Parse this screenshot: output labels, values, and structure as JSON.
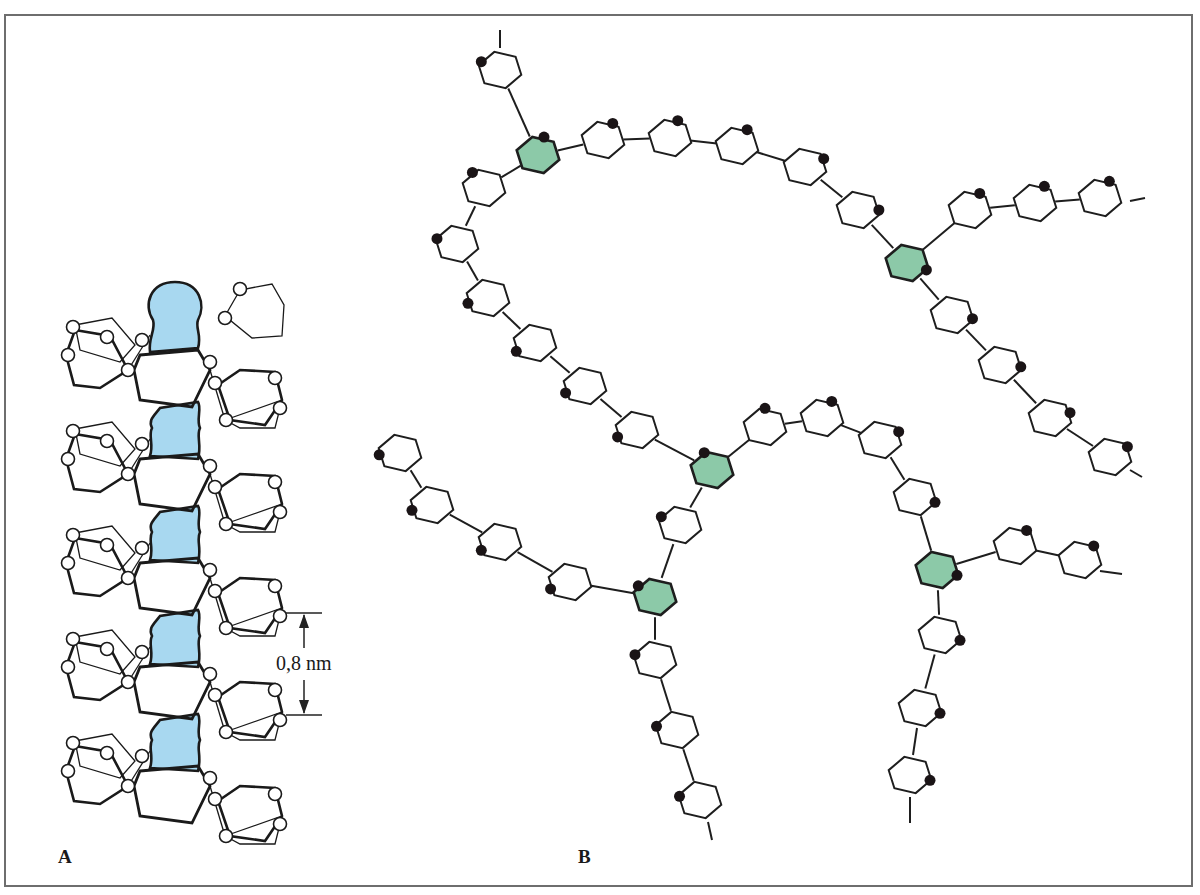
{
  "figure": {
    "panel_a": {
      "label": "A",
      "subject": "helical chain with blue central inclusion",
      "dimension_label": "0,8 nm",
      "inclusion_color": "#a8d8f0",
      "turns": 5
    },
    "panel_b": {
      "label": "B",
      "subject": "branched chain of hexagonal rings",
      "branch_color": "#8cc9a8",
      "ring_radius": 22,
      "rings": [
        {
          "x": 500,
          "y": 70,
          "r": 22,
          "dot": [
            -1,
            -0.5
          ],
          "branch": false
        },
        {
          "x": 538,
          "y": 155,
          "dot": [
            0.3,
            -1
          ],
          "branch": true
        },
        {
          "x": 603,
          "y": 140,
          "dot": [
            0.5,
            -0.95
          ],
          "branch": false
        },
        {
          "x": 670,
          "y": 138,
          "dot": [
            0.4,
            -1
          ],
          "branch": false
        },
        {
          "x": 737,
          "y": 146,
          "dot": [
            0.5,
            -0.9
          ],
          "branch": false
        },
        {
          "x": 805,
          "y": 167,
          "dot": [
            1,
            -0.5
          ],
          "branch": false
        },
        {
          "x": 858,
          "y": 210,
          "dot": [
            1,
            0
          ],
          "branch": false
        },
        {
          "x": 907,
          "y": 263,
          "dot": [
            1,
            0.4
          ],
          "branch": true
        },
        {
          "x": 952,
          "y": 315,
          "dot": [
            1,
            0.2
          ],
          "branch": false
        },
        {
          "x": 1000,
          "y": 365,
          "dot": [
            1,
            0.1
          ],
          "branch": false
        },
        {
          "x": 1050,
          "y": 418,
          "dot": [
            1,
            -0.3
          ],
          "branch": false
        },
        {
          "x": 1110,
          "y": 457,
          "dot": [
            0.9,
            -0.6
          ],
          "branch": false
        },
        {
          "x": 970,
          "y": 210,
          "dot": [
            0.5,
            -0.95
          ],
          "branch": false
        },
        {
          "x": 1035,
          "y": 203,
          "dot": [
            0.5,
            -1
          ],
          "branch": false
        },
        {
          "x": 1100,
          "y": 198,
          "dot": [
            0.5,
            -1
          ],
          "branch": false
        },
        {
          "x": 484,
          "y": 188,
          "dot": [
            -0.6,
            -0.9
          ],
          "branch": false
        },
        {
          "x": 457,
          "y": 244,
          "dot": [
            -1,
            -0.3
          ],
          "branch": false
        },
        {
          "x": 488,
          "y": 298,
          "dot": [
            -1,
            0.3
          ],
          "branch": false
        },
        {
          "x": 535,
          "y": 343,
          "dot": [
            -1,
            0.5
          ],
          "branch": false
        },
        {
          "x": 585,
          "y": 386,
          "dot": [
            -1,
            0.4
          ],
          "branch": false
        },
        {
          "x": 637,
          "y": 430,
          "dot": [
            -1,
            0.4
          ],
          "branch": false
        },
        {
          "x": 712,
          "y": 470,
          "dot": [
            -0.4,
            -1
          ],
          "branch": true
        },
        {
          "x": 765,
          "y": 427,
          "dot": [
            0,
            -1
          ],
          "branch": false
        },
        {
          "x": 822,
          "y": 418,
          "dot": [
            0.5,
            -0.95
          ],
          "branch": false
        },
        {
          "x": 880,
          "y": 440,
          "dot": [
            1,
            -0.5
          ],
          "branch": false
        },
        {
          "x": 915,
          "y": 497,
          "dot": [
            1,
            0.3
          ],
          "branch": false
        },
        {
          "x": 937,
          "y": 570,
          "dot": [
            1,
            0.3
          ],
          "branch": true
        },
        {
          "x": 1015,
          "y": 546,
          "dot": [
            0.6,
            -0.9
          ],
          "branch": false
        },
        {
          "x": 1080,
          "y": 560,
          "dot": [
            0.7,
            -0.8
          ],
          "branch": false
        },
        {
          "x": 940,
          "y": 635,
          "dot": [
            1,
            0.3
          ],
          "branch": false
        },
        {
          "x": 920,
          "y": 708,
          "dot": [
            1,
            0.3
          ],
          "branch": false
        },
        {
          "x": 910,
          "y": 775,
          "dot": [
            1,
            0.3
          ],
          "branch": false
        },
        {
          "x": 680,
          "y": 525,
          "dot": [
            -1,
            -0.5
          ],
          "branch": false
        },
        {
          "x": 655,
          "y": 597,
          "dot": [
            -0.8,
            -0.6
          ],
          "branch": true
        },
        {
          "x": 400,
          "y": 453,
          "dot": [
            -1,
            0.1
          ],
          "branch": false
        },
        {
          "x": 432,
          "y": 505,
          "dot": [
            -1,
            0.3
          ],
          "branch": false
        },
        {
          "x": 500,
          "y": 542,
          "dot": [
            -1,
            0.5
          ],
          "branch": false
        },
        {
          "x": 570,
          "y": 582,
          "dot": [
            -1,
            0.4
          ],
          "branch": false
        },
        {
          "x": 655,
          "y": 660,
          "dot": [
            -1,
            -0.3
          ],
          "branch": false
        },
        {
          "x": 677,
          "y": 730,
          "dot": [
            -1,
            -0.2
          ],
          "branch": false
        },
        {
          "x": 700,
          "y": 800,
          "dot": [
            -1,
            -0.2
          ],
          "branch": false
        }
      ],
      "links": [
        [
          0,
          1
        ],
        [
          1,
          2
        ],
        [
          2,
          3
        ],
        [
          3,
          4
        ],
        [
          4,
          5
        ],
        [
          5,
          6
        ],
        [
          6,
          7
        ],
        [
          7,
          8
        ],
        [
          8,
          9
        ],
        [
          9,
          10
        ],
        [
          10,
          11
        ],
        [
          7,
          12
        ],
        [
          12,
          13
        ],
        [
          13,
          14
        ],
        [
          1,
          15
        ],
        [
          15,
          16
        ],
        [
          16,
          17
        ],
        [
          17,
          18
        ],
        [
          18,
          19
        ],
        [
          19,
          20
        ],
        [
          20,
          21
        ],
        [
          21,
          22
        ],
        [
          22,
          23
        ],
        [
          23,
          24
        ],
        [
          24,
          25
        ],
        [
          25,
          26
        ],
        [
          26,
          27
        ],
        [
          27,
          28
        ],
        [
          26,
          29
        ],
        [
          29,
          30
        ],
        [
          30,
          31
        ],
        [
          21,
          32
        ],
        [
          32,
          33
        ],
        [
          34,
          35
        ],
        [
          35,
          36
        ],
        [
          36,
          37
        ],
        [
          37,
          33
        ],
        [
          33,
          38
        ],
        [
          38,
          39
        ],
        [
          39,
          40
        ]
      ],
      "chain_ends": [
        {
          "from": [
            500,
            48
          ],
          "to": [
            500,
            30
          ]
        },
        {
          "from": [
            1130,
            201
          ],
          "to": [
            1145,
            198
          ]
        },
        {
          "from": [
            1130,
            470
          ],
          "to": [
            1142,
            477
          ]
        },
        {
          "from": [
            1100,
            571
          ],
          "to": [
            1122,
            574
          ]
        },
        {
          "from": [
            910,
            797
          ],
          "to": [
            910,
            823
          ]
        },
        {
          "from": [
            708,
            822
          ],
          "to": [
            712,
            840
          ]
        }
      ]
    }
  }
}
